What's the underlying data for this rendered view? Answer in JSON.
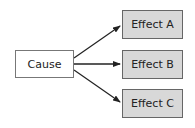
{
  "diagram": {
    "type": "cause-effect",
    "cause": {
      "label": "Cause"
    },
    "effects": [
      {
        "label": "Effect A"
      },
      {
        "label": "Effect B"
      },
      {
        "label": "Effect C"
      }
    ],
    "colors": {
      "cause_fill": "#ffffff",
      "effect_fill": "#d8d8d8",
      "border": "#666666",
      "arrow": "#222222"
    }
  }
}
